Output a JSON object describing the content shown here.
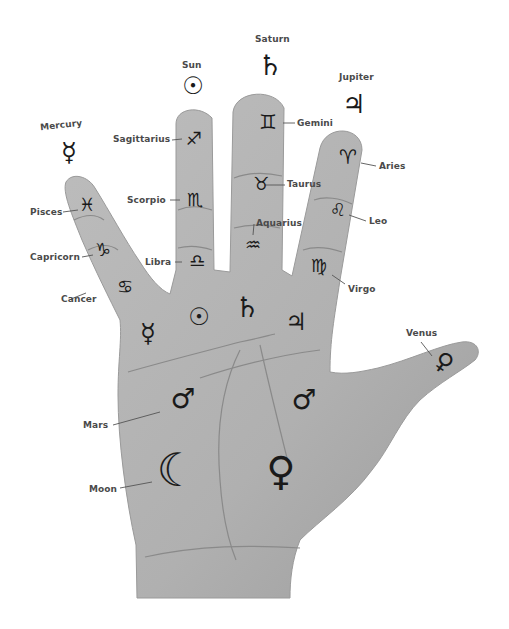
{
  "diagram": {
    "colors": {
      "skin": "#b3b3b3",
      "skin_dark": "#8f8f8f",
      "ink": "#1a1a1a",
      "label": "#4a4a4a",
      "background": "#ffffff"
    }
  },
  "planets_above": [
    {
      "name": "Mercury",
      "symbol": "☿",
      "icon": "mercury-icon"
    },
    {
      "name": "Sun",
      "symbol": "☉",
      "icon": "sun-icon"
    },
    {
      "name": "Saturn",
      "symbol": "♄",
      "icon": "saturn-icon"
    },
    {
      "name": "Jupiter",
      "symbol": "♃",
      "icon": "jupiter-icon"
    }
  ],
  "zodiac": [
    {
      "name": "Sagittarius",
      "symbol": "♐",
      "finger": "ring"
    },
    {
      "name": "Scorpio",
      "symbol": "♏",
      "finger": "ring"
    },
    {
      "name": "Libra",
      "symbol": "♎",
      "finger": "ring"
    },
    {
      "name": "Gemini",
      "symbol": "♊",
      "finger": "middle"
    },
    {
      "name": "Taurus",
      "symbol": "♉",
      "finger": "middle"
    },
    {
      "name": "Aquarius",
      "symbol": "♒",
      "finger": "middle"
    },
    {
      "name": "Aries",
      "symbol": "♈",
      "finger": "index"
    },
    {
      "name": "Leo",
      "symbol": "♌",
      "finger": "index"
    },
    {
      "name": "Virgo",
      "symbol": "♍",
      "finger": "index"
    },
    {
      "name": "Pisces",
      "symbol": "♓",
      "finger": "little"
    },
    {
      "name": "Capricorn",
      "symbol": "♑",
      "finger": "little"
    },
    {
      "name": "Cancer",
      "symbol": "♋",
      "finger": "little"
    }
  ],
  "palm_mounts": [
    {
      "name": "Mercury",
      "symbol": "☿"
    },
    {
      "name": "Sun",
      "symbol": "☉"
    },
    {
      "name": "Saturn",
      "symbol": "♄"
    },
    {
      "name": "Jupiter",
      "symbol": "♃"
    },
    {
      "name": "Mars",
      "symbol": "♂",
      "labeled": true
    },
    {
      "name": "Mars (upper)",
      "symbol": "♂"
    },
    {
      "name": "Moon",
      "symbol": "☾",
      "labeled": true
    },
    {
      "name": "Venus",
      "symbol": "♀"
    },
    {
      "name": "Venus (thumb)",
      "symbol": "♀",
      "labeled": true
    }
  ]
}
